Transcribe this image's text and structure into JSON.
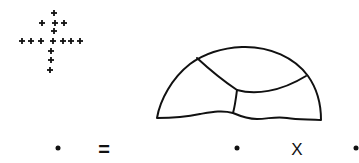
{
  "figure": {
    "stroke_color": "#111111",
    "background": "#ffffff"
  },
  "plus_cluster": {
    "glyph": "+",
    "marks": [
      {
        "x": 54,
        "y": 13
      },
      {
        "x": 42,
        "y": 23
      },
      {
        "x": 55,
        "y": 23
      },
      {
        "x": 64,
        "y": 23
      },
      {
        "x": 54,
        "y": 31
      },
      {
        "x": 22,
        "y": 41
      },
      {
        "x": 31,
        "y": 41
      },
      {
        "x": 41,
        "y": 41
      },
      {
        "x": 53,
        "y": 41
      },
      {
        "x": 63,
        "y": 41
      },
      {
        "x": 71,
        "y": 41
      },
      {
        "x": 80,
        "y": 41
      },
      {
        "x": 51,
        "y": 51
      },
      {
        "x": 51,
        "y": 60
      },
      {
        "x": 50,
        "y": 70
      }
    ]
  },
  "dome": {
    "regions": 4
  },
  "equation_row": {
    "items": [
      {
        "type": "dot",
        "x": 58,
        "y": 148
      },
      {
        "type": "operator",
        "label": "=",
        "x": 104,
        "y": 149
      },
      {
        "type": "dot",
        "x": 237,
        "y": 148
      },
      {
        "type": "operator",
        "label": "X",
        "x": 297,
        "y": 149
      },
      {
        "type": "dot",
        "x": 356,
        "y": 148
      }
    ]
  }
}
